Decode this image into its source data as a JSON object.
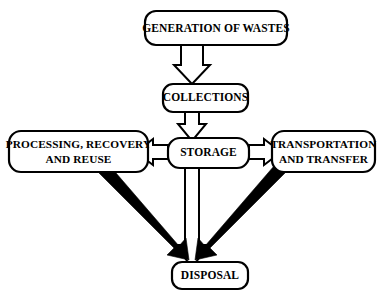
{
  "diagram": {
    "background_color": "#ffffff",
    "line_color": "#000000",
    "nodes": {
      "generation": {
        "label": "GENERATION OF WASTES",
        "lines": [
          "GENERATION OF WASTES"
        ]
      },
      "collections": {
        "label": "COLLECTIONS",
        "lines": [
          "COLLECTIONS"
        ]
      },
      "processing": {
        "label": "PROCESSING, RECOVERY AND REUSE",
        "lines": [
          "PROCESSING, RECOVERY",
          "AND REUSE"
        ]
      },
      "storage": {
        "label": "STORAGE",
        "lines": [
          "STORAGE"
        ]
      },
      "transportation": {
        "label": "TRANSPORTATION AND TRANSFER",
        "lines": [
          "TRANSPORTATION",
          "AND TRANSFER"
        ]
      },
      "disposal": {
        "label": "DISPOSAL",
        "lines": [
          "DISPOSAL"
        ]
      }
    },
    "connectors": [
      {
        "name": "generation-to-collections",
        "from": "generation",
        "to": "collections",
        "style": "hollow-block-arrow",
        "direction": "down"
      },
      {
        "name": "collections-to-storage",
        "from": "collections",
        "to": "storage",
        "style": "hollow-block-arrow",
        "direction": "down"
      },
      {
        "name": "storage-to-processing",
        "from": "storage",
        "to": "processing",
        "style": "hollow-block-arrow",
        "direction": "left"
      },
      {
        "name": "storage-to-transportation",
        "from": "storage",
        "to": "transportation",
        "style": "hollow-block-arrow",
        "direction": "right"
      },
      {
        "name": "storage-to-disposal",
        "from": "storage",
        "to": "disposal",
        "style": "hollow-block-arrow",
        "direction": "down"
      },
      {
        "name": "processing-to-disposal",
        "from": "processing",
        "to": "disposal",
        "style": "solid-thick-arrow",
        "direction": "down-right"
      },
      {
        "name": "transportation-to-disposal",
        "from": "transportation",
        "to": "disposal",
        "style": "solid-thick-arrow",
        "direction": "down-left"
      }
    ]
  }
}
